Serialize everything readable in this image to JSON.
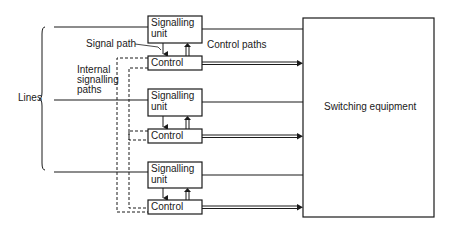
{
  "diagram": {
    "labels": {
      "lines": "Lines",
      "signal_path": "Signal path",
      "control_paths": "Control paths",
      "internal_1": "Internal",
      "internal_2": "signalling",
      "internal_3": "paths",
      "switching_equipment": "Switching equipment"
    },
    "units": [
      {
        "signalling_line1": "Signalling",
        "signalling_line2": "unit",
        "control": "Control"
      },
      {
        "signalling_line1": "Signalling",
        "signalling_line2": "unit",
        "control": "Control"
      },
      {
        "signalling_line1": "Signalling",
        "signalling_line2": "unit",
        "control": "Control"
      }
    ],
    "colors": {
      "stroke": "#1a1a1a",
      "background": "#ffffff"
    }
  }
}
